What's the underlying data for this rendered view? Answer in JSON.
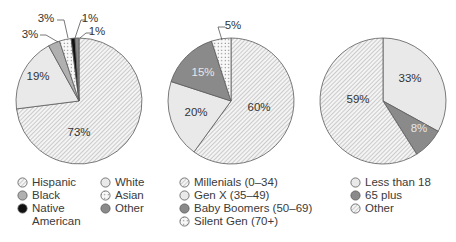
{
  "chart_data": [
    {
      "type": "pie",
      "title": "",
      "start_angle_deg": 0,
      "direction": "clockwise",
      "slices": [
        {
          "label": "Hispanic",
          "value": 73,
          "display": "73%",
          "fill": "hatch"
        },
        {
          "label": "White",
          "value": 19,
          "display": "19%",
          "fill": "light"
        },
        {
          "label": "Black",
          "value": 3,
          "display": "3%",
          "fill": "mid"
        },
        {
          "label": "Asian",
          "value": 3,
          "display": "3%",
          "fill": "dots"
        },
        {
          "label": "Native American",
          "value": 1,
          "display": "1%",
          "fill": "black"
        },
        {
          "label": "Other",
          "value": 1,
          "display": "1%",
          "fill": "dark"
        }
      ],
      "legend": {
        "columns": 2,
        "position": "bottom"
      }
    },
    {
      "type": "pie",
      "title": "",
      "start_angle_deg": 0,
      "direction": "clockwise",
      "slices": [
        {
          "label": "Millenials (0–34)",
          "value": 60,
          "display": "60%",
          "fill": "hatch"
        },
        {
          "label": "Gen X (35–49)",
          "value": 20,
          "display": "20%",
          "fill": "light"
        },
        {
          "label": "Baby Boomers (50–69)",
          "value": 15,
          "display": "15%",
          "fill": "dark"
        },
        {
          "label": "Silent Gen (70+)",
          "value": 5,
          "display": "5%",
          "fill": "dots"
        }
      ],
      "legend": {
        "columns": 1,
        "position": "bottom"
      }
    },
    {
      "type": "pie",
      "title": "",
      "start_angle_deg": 0,
      "direction": "clockwise",
      "slices": [
        {
          "label": "Less than 18",
          "value": 33,
          "display": "33%",
          "fill": "light"
        },
        {
          "label": "65 plus",
          "value": 8,
          "display": "8%",
          "fill": "dark"
        },
        {
          "label": "Other",
          "value": 59,
          "display": "59%",
          "fill": "hatch"
        }
      ],
      "legend": {
        "columns": 1,
        "position": "bottom"
      }
    }
  ],
  "legends": {
    "pie1_col1": [
      "Hispanic",
      "Black",
      "Native\nAmerican"
    ],
    "pie1_col2": [
      "White",
      "Asian",
      "Other"
    ],
    "pie2": [
      "Millenials (0–34)",
      "Gen X (35–49)",
      "Baby Boomers (50–69)",
      "Silent Gen (70+)"
    ],
    "pie3": [
      "Less than 18",
      "65 plus",
      "Other"
    ]
  },
  "colors": {
    "light": "#e9e9e9",
    "mid": "#b0b0b0",
    "dark": "#8a8a8a",
    "black": "#111111",
    "outline": "#5a5a5a"
  }
}
